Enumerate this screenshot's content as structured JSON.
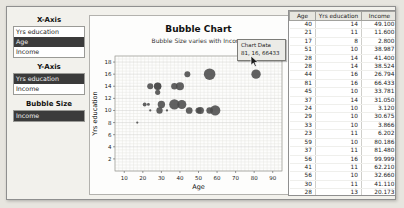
{
  "sidebar": {
    "x_axis": {
      "label": "X-Axis",
      "options": [
        {
          "label": "Yrs education",
          "selected": false
        },
        {
          "label": "Age",
          "selected": true
        },
        {
          "label": "Income",
          "selected": false
        }
      ]
    },
    "y_axis": {
      "label": "Y-Axis",
      "options": [
        {
          "label": "Yrs education",
          "selected": true
        },
        {
          "label": "Income",
          "selected": false
        }
      ]
    },
    "bubble_size": {
      "label": "Bubble Size",
      "options": [
        {
          "label": "Income",
          "selected": true
        }
      ]
    }
  },
  "chart_data": {
    "type": "scatter",
    "title": "Bubble Chart",
    "subtitle": "Bubble Size varies with Income",
    "xlabel": "Age",
    "ylabel": "Yrs education",
    "xlim": [
      5,
      95
    ],
    "ylim": [
      0,
      19
    ],
    "xticks": [
      10,
      20,
      30,
      40,
      50,
      60,
      70,
      80,
      90
    ],
    "yticks": [
      2,
      4,
      6,
      8,
      10,
      12,
      14,
      16,
      18
    ],
    "grid": true,
    "size_field": "income",
    "bubble_color": "#4b4b4b",
    "points": [
      {
        "age": 40,
        "yrs_education": 14,
        "income": 49100
      },
      {
        "age": 21,
        "yrs_education": 11,
        "income": 11600
      },
      {
        "age": 17,
        "yrs_education": 8,
        "income": 2800
      },
      {
        "age": 51,
        "yrs_education": 10,
        "income": 38987
      },
      {
        "age": 28,
        "yrs_education": 14,
        "income": 41400
      },
      {
        "age": 28,
        "yrs_education": 14,
        "income": 38524
      },
      {
        "age": 44,
        "yrs_education": 16,
        "income": 26794
      },
      {
        "age": 81,
        "yrs_education": 16,
        "income": 66433
      },
      {
        "age": 45,
        "yrs_education": 10,
        "income": 33781
      },
      {
        "age": 37,
        "yrs_education": 14,
        "income": 31050
      },
      {
        "age": 24,
        "yrs_education": 10,
        "income": 3120
      },
      {
        "age": 29,
        "yrs_education": 10,
        "income": 30675
      },
      {
        "age": 33,
        "yrs_education": 10,
        "income": 3866
      },
      {
        "age": 23,
        "yrs_education": 11,
        "income": 6202
      },
      {
        "age": 59,
        "yrs_education": 10,
        "income": 80186
      },
      {
        "age": 37,
        "yrs_education": 11,
        "income": 81480
      },
      {
        "age": 56,
        "yrs_education": 16,
        "income": 99999
      },
      {
        "age": 41,
        "yrs_education": 11,
        "income": 62210
      },
      {
        "age": 56,
        "yrs_education": 10,
        "income": 32660
      },
      {
        "age": 30,
        "yrs_education": 11,
        "income": 41110
      },
      {
        "age": 28,
        "yrs_education": 13,
        "income": 20173
      },
      {
        "age": 50,
        "yrs_education": 10,
        "income": 27580
      },
      {
        "age": 24,
        "yrs_education": 14,
        "income": 28000
      }
    ]
  },
  "tooltip": {
    "title": "Chart Data",
    "value": "81, 16, 66433"
  },
  "table": {
    "columns": [
      "Age",
      "Yrs education",
      "Income"
    ],
    "rows": [
      [
        40,
        14,
        "49.100"
      ],
      [
        21,
        11,
        "11.600"
      ],
      [
        17,
        8,
        "2.800"
      ],
      [
        51,
        10,
        "38.987"
      ],
      [
        28,
        14,
        "41.400"
      ],
      [
        28,
        14,
        "38.524"
      ],
      [
        44,
        16,
        "26.794"
      ],
      [
        81,
        16,
        "66.433"
      ],
      [
        45,
        10,
        "33.781"
      ],
      [
        37,
        14,
        "31.050"
      ],
      [
        24,
        10,
        "3.120"
      ],
      [
        29,
        10,
        "30.675"
      ],
      [
        33,
        10,
        "3.866"
      ],
      [
        23,
        11,
        "6.202"
      ],
      [
        59,
        10,
        "80.186"
      ],
      [
        37,
        11,
        "81.480"
      ],
      [
        56,
        16,
        "99.999"
      ],
      [
        41,
        11,
        "62.210"
      ],
      [
        56,
        10,
        "32.660"
      ],
      [
        30,
        11,
        "41.110"
      ],
      [
        28,
        13,
        "20.173"
      ],
      [
        50,
        10,
        "27.580"
      ],
      [
        24,
        14,
        "28.000"
      ]
    ]
  }
}
